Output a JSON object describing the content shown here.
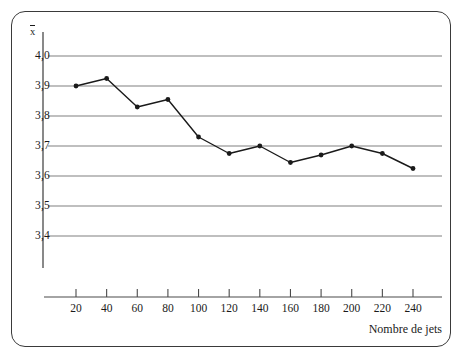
{
  "chart_data": {
    "type": "line",
    "title": "",
    "subtitle": "",
    "xlabel": "Nombre de jets",
    "ylabel": "x̄",
    "x": [
      20,
      40,
      60,
      80,
      100,
      120,
      140,
      160,
      180,
      200,
      220,
      240
    ],
    "values": [
      3.9,
      3.925,
      3.83,
      3.855,
      3.73,
      3.675,
      3.7,
      3.645,
      3.67,
      3.7,
      3.675,
      3.625
    ],
    "series": [
      {
        "name": "",
        "values": [
          3.9,
          3.925,
          3.83,
          3.855,
          3.73,
          3.675,
          3.7,
          3.645,
          3.67,
          3.7,
          3.675,
          3.625
        ]
      }
    ],
    "xlim": [
      0,
      260
    ],
    "ylim": [
      3.4,
      4.0
    ],
    "xticks": [
      20,
      40,
      60,
      80,
      100,
      120,
      140,
      160,
      180,
      200,
      220,
      240
    ],
    "xtick_labels": [
      "20",
      "40",
      "60",
      "80",
      "100",
      "120",
      "140",
      "160",
      "180",
      "200",
      "220",
      "240"
    ],
    "yticks": [
      4.0,
      3.9,
      3.8,
      3.7,
      3.6,
      3.5,
      3.4
    ],
    "ytick_labels": [
      "4,0",
      "3,9",
      "3,8",
      "3,7",
      "3,6",
      "3,5",
      "3,4"
    ],
    "grid": true,
    "grid_axis": "y",
    "legend": "none",
    "marker": "filled-circle",
    "line_color": "#1a1a1a",
    "marker_color": "#1a1a1a",
    "grid_color": "#808080",
    "axis_color": "#4a4a4a",
    "frame_color": "#3a3a3a",
    "background": "#ffffff"
  }
}
